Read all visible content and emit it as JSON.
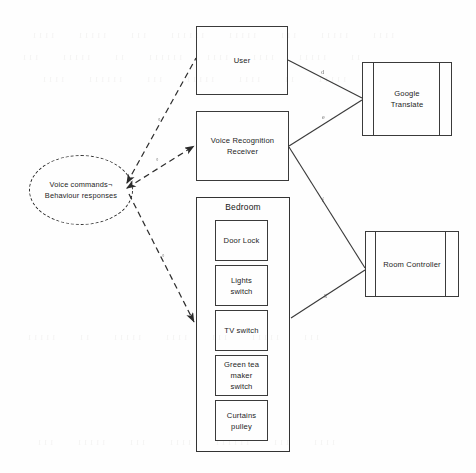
{
  "diagram": {
    "background_color": "#fefefe",
    "line_color": "#3a3a3a",
    "text_color": "#1d1d1d",
    "nodes": {
      "voice_commands": {
        "label_line1": "Voice commands¬",
        "label_line2": "Behaviour responses",
        "shape": "dashed-ellipse"
      },
      "user": {
        "label": "User",
        "shape": "rectangle"
      },
      "voice_recognition_receiver": {
        "label_line1": "Voice Recognition",
        "label_line2": "Receiver",
        "shape": "rectangle"
      },
      "google_translate": {
        "label_line1": "Google",
        "label_line2": "Translate",
        "shape": "component"
      },
      "room_controller": {
        "label": "Room Controller",
        "shape": "component"
      }
    },
    "bedroom_group": {
      "title": "Bedroom",
      "devices": [
        {
          "label": "Door Lock"
        },
        {
          "label": "Lights switch"
        },
        {
          "label": "TV switch"
        },
        {
          "label_line1": "Green tea",
          "label_line2": "maker switch"
        },
        {
          "label_line1": "Curtains",
          "label_line2": "pulley"
        }
      ]
    },
    "edges": [
      {
        "from": "voice_commands",
        "to": "user",
        "style": "dashed",
        "arrow": "both",
        "mark": "°"
      },
      {
        "from": "voice_commands",
        "to": "voice_recognition_receiver",
        "style": "dashed",
        "arrow": "to",
        "mark": "°"
      },
      {
        "from": "voice_commands",
        "to": "bedroom_group",
        "style": "dashed",
        "arrow": "to",
        "mark": "°"
      },
      {
        "from": "user",
        "to": "google_translate",
        "style": "solid",
        "arrow": "none",
        "mark": "d"
      },
      {
        "from": "voice_recognition_receiver",
        "to": "google_translate",
        "style": "solid",
        "arrow": "none",
        "mark": "e"
      },
      {
        "from": "voice_recognition_receiver",
        "to": "room_controller",
        "style": "solid",
        "arrow": "none",
        "mark": "f"
      },
      {
        "from": "bedroom_group",
        "to": "room_controller",
        "style": "solid",
        "arrow": "none",
        "mark": "g"
      }
    ]
  },
  "ghost_text": {
    "rows": [
      "ıııı ııııı ııı ııııı ıııııı ııı ııııı ıııı",
      "ıı ııııı ıııı ıııı ıııııı ıı ııııı ııı",
      "ııııı ıı ıııı ııııı ııı ıııııı ıııı",
      "ııı ııııı ııı ıııı ııııı ıı ııııı",
      "ıııı ııı ıııııı ıııı ııı ııııı ııı"
    ]
  }
}
